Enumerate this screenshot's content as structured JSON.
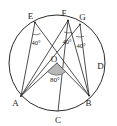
{
  "figure": {
    "type": "circle-geometry-diagram",
    "background_color": "#ffffff",
    "stroke_color": "#2b2b2b",
    "shade_color": "#b7b7b7"
  },
  "circle": {
    "center_label": "O",
    "cx": 57,
    "cy": 63,
    "r": 48
  },
  "points": [
    {
      "id": "E",
      "label": "E",
      "x": 35.0,
      "y": 22.5,
      "label_x": 30.5,
      "label_y": 18.5
    },
    {
      "id": "F",
      "label": "F",
      "x": 68.0,
      "y": 20.5,
      "label_x": 64.0,
      "label_y": 16.0
    },
    {
      "id": "G",
      "label": "G",
      "x": 80.0,
      "y": 24.5,
      "label_x": 79.0,
      "label_y": 18.5
    },
    {
      "id": "D",
      "label": "D",
      "x": 103.0,
      "y": 62.0,
      "label_x": 99.0,
      "label_y": 68.0
    },
    {
      "id": "B",
      "label": "B",
      "x": 89.0,
      "y": 95.5,
      "label_x": 86.0,
      "label_y": 105.0
    },
    {
      "id": "C",
      "label": "C",
      "x": 58.0,
      "y": 111.0,
      "label_x": 55.0,
      "label_y": 122.0
    },
    {
      "id": "A",
      "label": "A",
      "x": 21.0,
      "y": 96.0,
      "label_x": 13.0,
      "label_y": 105.0
    },
    {
      "id": "O",
      "label": "O",
      "x": 57.0,
      "y": 63.0,
      "label_x": 52.0,
      "label_y": 62.0
    }
  ],
  "angles": [
    {
      "id": "angle-E",
      "at": "E",
      "value": "40°",
      "label_x": 32.0,
      "label_y": 43.0
    },
    {
      "id": "angle-F",
      "at": "F",
      "value": "40°",
      "label_x": 62.5,
      "label_y": 42.0
    },
    {
      "id": "angle-G",
      "at": "G",
      "value": "40°",
      "label_x": 77.0,
      "label_y": 46.0
    },
    {
      "id": "angle-O",
      "at": "O",
      "value": "80°",
      "label_x": 47.0,
      "label_y": 80.0
    }
  ],
  "segments": [
    {
      "id": "EA",
      "from": "E",
      "to": "A"
    },
    {
      "id": "EB",
      "from": "E",
      "to": "B"
    },
    {
      "id": "FA",
      "from": "F",
      "to": "A"
    },
    {
      "id": "FB",
      "from": "F",
      "to": "B"
    },
    {
      "id": "GA",
      "from": "G",
      "to": "A"
    },
    {
      "id": "GB",
      "from": "G",
      "to": "B"
    },
    {
      "id": "OA",
      "from": "O",
      "to": "A"
    },
    {
      "id": "OB",
      "from": "O",
      "to": "B"
    },
    {
      "id": "FC",
      "from": "F",
      "to": "C"
    },
    {
      "id": "EG",
      "from": "E",
      "to": "G"
    }
  ]
}
